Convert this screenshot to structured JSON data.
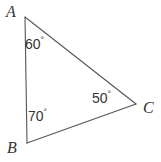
{
  "figure": {
    "kind": "triangle-diagram",
    "background_color": "#ffffff",
    "stroke_color": "#555555",
    "text_color": "#333333",
    "width": 161,
    "height": 162,
    "vertices": [
      {
        "name": "A",
        "label": "A",
        "x": 25,
        "y": 17
      },
      {
        "name": "B",
        "label": "B",
        "x": 27,
        "y": 143
      },
      {
        "name": "C",
        "label": "C",
        "x": 136,
        "y": 104
      }
    ],
    "edges": [
      {
        "name": "edge-AB",
        "from": "A",
        "to": "B"
      },
      {
        "name": "edge-AC",
        "from": "A",
        "to": "C"
      },
      {
        "name": "edge-BC",
        "from": "B",
        "to": "C"
      }
    ],
    "angles": [
      {
        "at": "A",
        "value": "60",
        "degree_symbol": "°",
        "text": "60°"
      },
      {
        "at": "B",
        "value": "70",
        "degree_symbol": "°",
        "text": "70°"
      },
      {
        "at": "C",
        "value": "50",
        "degree_symbol": "°",
        "text": "50°"
      }
    ]
  }
}
